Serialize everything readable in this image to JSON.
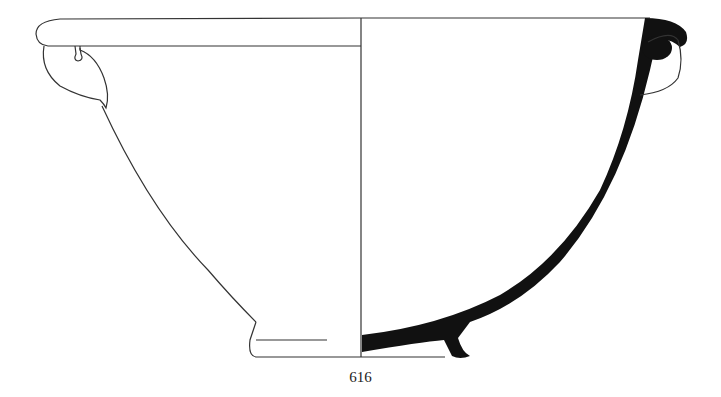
{
  "figure": {
    "catalogue_number": "616",
    "colors": {
      "background": "#ffffff",
      "outline": "#333333",
      "section_fill": "#111111"
    }
  }
}
